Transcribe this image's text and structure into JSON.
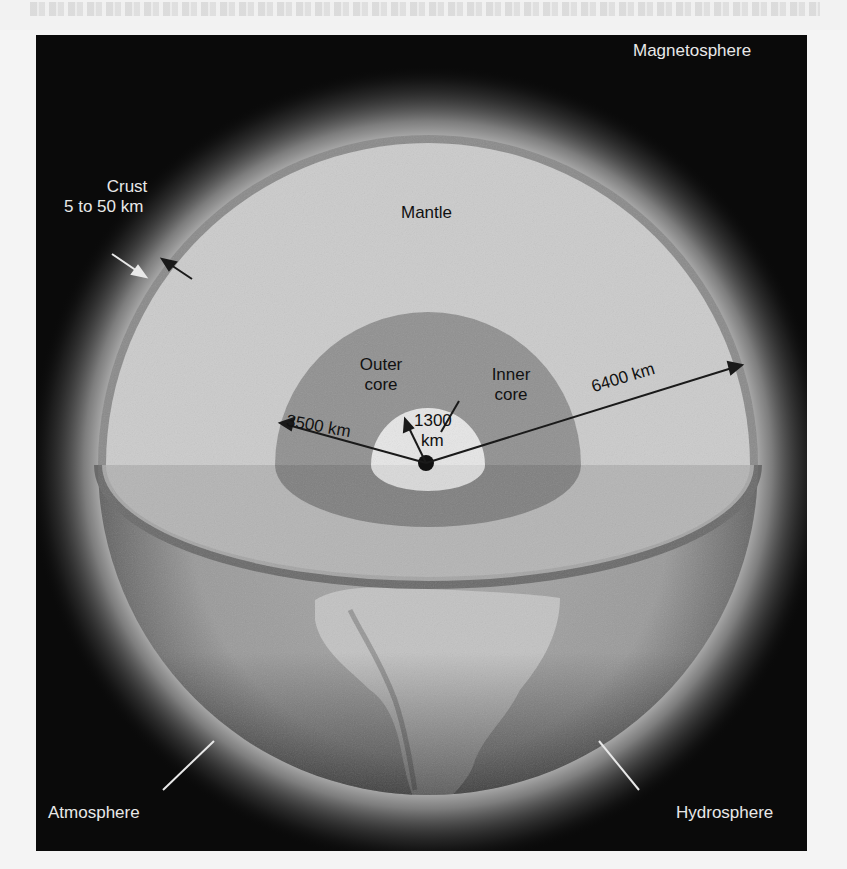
{
  "diagram": {
    "labels": {
      "magnetosphere": "Magnetosphere",
      "crust_name": "Crust",
      "crust_thickness": "5 to 50 km",
      "mantle": "Mantle",
      "outer_core_line1": "Outer",
      "outer_core_line2": "core",
      "inner_core_line1": "Inner",
      "inner_core_line2": "core",
      "inner_radius_value": "1300",
      "inner_radius_unit": "km",
      "outer_core_radius": "3500 km",
      "earth_radius": "6400 km",
      "atmosphere": "Atmosphere",
      "hydrosphere": "Hydrosphere"
    },
    "colors": {
      "space": "#0a0a0a",
      "glow": "#d8d8d8",
      "crust": "#8a8a8a",
      "mantle": "#c9c9c9",
      "outer_core": "#8f8f8f",
      "inner_core": "#e4e4e4",
      "center_dot": "#111111",
      "surface": "#9e9e9e",
      "continent": "#c8c8c8",
      "arrows": "#1a1a1a",
      "light_text": "#e8e8e8",
      "dark_text": "#111111"
    }
  }
}
